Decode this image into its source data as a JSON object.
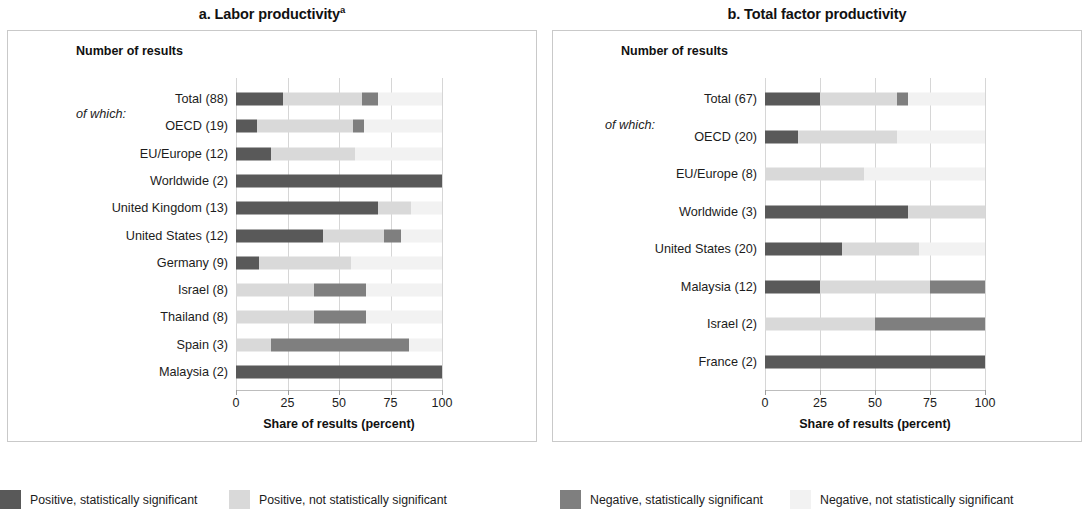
{
  "colors": {
    "positive_significant": "#595959",
    "positive_not_significant": "#d9d9d9",
    "negative_significant": "#7f7f7f",
    "negative_not_significant": "#f2f2f2",
    "grid": "#d6d6d6",
    "frame": "#c9c9c9",
    "text": "#1c1c1c"
  },
  "legend": {
    "items": [
      {
        "label": "Positive, statistically significant",
        "color": "#595959",
        "key": "positive_significant"
      },
      {
        "label": "Positive, not statistically significant",
        "color": "#d9d9d9",
        "key": "positive_not_significant"
      },
      {
        "label": "Negative, statistically significant",
        "color": "#7f7f7f",
        "key": "negative_significant"
      },
      {
        "label": "Negative, not statistically significant",
        "color": "#f2f2f2",
        "key": "negative_not_significant"
      }
    ]
  },
  "panel_a": {
    "title": "a. Labor productivity",
    "title_superscript": "a",
    "axis_header": "Number of results",
    "of_which_label": "of which:",
    "of_which_row_index": 1
  },
  "panel_b": {
    "title": "b. Total factor productivity",
    "title_superscript": "",
    "axis_header": "Number of results",
    "of_which_label": "of which:",
    "of_which_row_index": 1
  },
  "chart_data": [
    {
      "type": "bar",
      "orientation": "horizontal",
      "stacked": true,
      "stacked_100": true,
      "title": "a. Labor productivity",
      "title_note": "a",
      "xlabel": "Share of results (percent)",
      "ylabel": "Number of results",
      "xlim": [
        0,
        100
      ],
      "xticks": [
        0,
        25,
        50,
        75,
        100
      ],
      "xticklabels": [
        "0",
        "25",
        "50",
        "75",
        "100"
      ],
      "grid": true,
      "legend_position": "below-figure",
      "series": [
        {
          "name": "Positive, statistically significant",
          "color": "#595959",
          "values": [
            23,
            10,
            17,
            100,
            69,
            42,
            11,
            0,
            0,
            0,
            100
          ]
        },
        {
          "name": "Positive, not statistically significant",
          "color": "#d9d9d9",
          "values": [
            38,
            47,
            41,
            0,
            16,
            30,
            45,
            38,
            38,
            17,
            0
          ]
        },
        {
          "name": "Negative, statistically significant",
          "color": "#7f7f7f",
          "values": [
            8,
            5,
            0,
            0,
            0,
            8,
            0,
            25,
            25,
            67,
            0
          ]
        },
        {
          "name": "Negative, not statistically significant",
          "color": "#f2f2f2",
          "values": [
            31,
            38,
            42,
            0,
            15,
            20,
            44,
            37,
            37,
            16,
            0
          ]
        }
      ],
      "categories": [
        "Total (88)",
        "OECD (19)",
        "EU/Europe (12)",
        "Worldwide (2)",
        "United Kingdom (13)",
        "United States (12)",
        "Germany (9)",
        "Israel (8)",
        "Thailand (8)",
        "Spain (3)",
        "Malaysia (2)"
      ],
      "category_counts": [
        88,
        19,
        12,
        2,
        13,
        12,
        9,
        8,
        8,
        3,
        2
      ]
    },
    {
      "type": "bar",
      "orientation": "horizontal",
      "stacked": true,
      "stacked_100": true,
      "title": "b. Total factor productivity",
      "title_note": "",
      "xlabel": "Share of results (percent)",
      "ylabel": "Number of results",
      "xlim": [
        0,
        100
      ],
      "xticks": [
        0,
        25,
        50,
        75,
        100
      ],
      "xticklabels": [
        "0",
        "25",
        "50",
        "75",
        "100"
      ],
      "grid": true,
      "legend_position": "below-figure",
      "series": [
        {
          "name": "Positive, statistically significant",
          "color": "#595959",
          "values": [
            25,
            15,
            0,
            65,
            35,
            25,
            0,
            100
          ]
        },
        {
          "name": "Positive, not statistically significant",
          "color": "#d9d9d9",
          "values": [
            35,
            45,
            45,
            35,
            35,
            50,
            50,
            0
          ]
        },
        {
          "name": "Negative, statistically significant",
          "color": "#7f7f7f",
          "values": [
            5,
            0,
            0,
            0,
            0,
            25,
            50,
            0
          ]
        },
        {
          "name": "Negative, not statistically significant",
          "color": "#f2f2f2",
          "values": [
            35,
            40,
            55,
            0,
            30,
            0,
            0,
            0
          ]
        }
      ],
      "categories": [
        "Total (67)",
        "OECD (20)",
        "EU/Europe (8)",
        "Worldwide (3)",
        "United States (20)",
        "Malaysia (12)",
        "Israel (2)",
        "France (2)"
      ],
      "category_counts": [
        67,
        20,
        8,
        3,
        20,
        12,
        2,
        2
      ]
    }
  ]
}
